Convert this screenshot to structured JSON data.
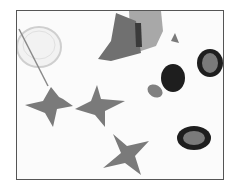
{
  "image": {
    "description": "Grayscale craft illustration: hand cutting felt/paper, dish with stick, three gray X shapes, three dark O shapes with gray centers, small gray ovals and triangle",
    "colors": {
      "frame_border": "#555555",
      "background": "#fbfbfb",
      "x_shape": "#7a7a7a",
      "o_outer": "#1e1e1e",
      "o_inner": "#7a7a7a",
      "hand": "#9a9a9a",
      "paper": "#6e6e6e"
    }
  }
}
